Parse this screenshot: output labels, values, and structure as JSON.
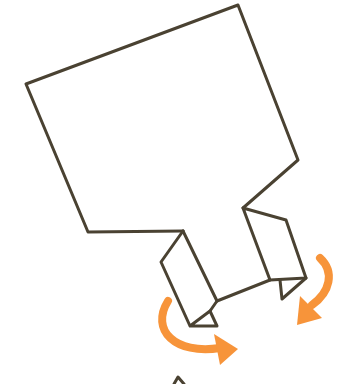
{
  "diagram": {
    "title": "Origami step: fold flaps outward",
    "colors": {
      "ink": "#4a4232",
      "arrow": "#f7943a",
      "background": "#ffffff"
    },
    "elements": [
      {
        "name": "paper-body",
        "type": "outline"
      },
      {
        "name": "left-flap",
        "type": "folded-flap"
      },
      {
        "name": "right-flap",
        "type": "folded-flap"
      },
      {
        "name": "left-fold-arrow",
        "type": "curved-arrow",
        "direction": "clockwise"
      },
      {
        "name": "right-fold-arrow",
        "type": "curved-arrow",
        "direction": "clockwise"
      }
    ]
  }
}
